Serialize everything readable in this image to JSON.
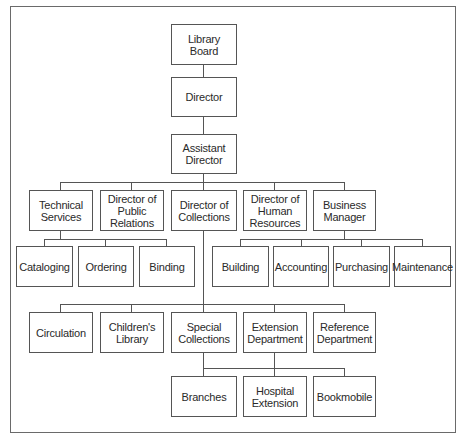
{
  "chart": {
    "type": "org-chart",
    "nodes": {
      "library_board": "Library\nBoard",
      "director": "Director",
      "assistant_director": "Assistant\nDirector",
      "technical_services": "Technical\nServices",
      "public_relations": "Director of\nPublic\nRelations",
      "collections": "Director of\nCollections",
      "human_resources": "Director of\nHuman\nResources",
      "business_manager": "Business\nManager",
      "cataloging": "Cataloging",
      "ordering": "Ordering",
      "binding": "Binding",
      "building": "Building",
      "accounting": "Accounting",
      "purchasing": "Purchasing",
      "maintenance": "Maintenance",
      "circulation": "Circulation",
      "childrens_library": "Children's\nLibrary",
      "special_collections": "Special\nCollections",
      "extension_department": "Extension\nDepartment",
      "reference_department": "Reference\nDepartment",
      "branches": "Branches",
      "hospital_extension": "Hospital\nExtension",
      "bookmobile": "Bookmobile"
    },
    "edges": [
      [
        "library_board",
        "director"
      ],
      [
        "director",
        "assistant_director"
      ],
      [
        "assistant_director",
        "technical_services"
      ],
      [
        "assistant_director",
        "public_relations"
      ],
      [
        "assistant_director",
        "collections"
      ],
      [
        "assistant_director",
        "human_resources"
      ],
      [
        "assistant_director",
        "business_manager"
      ],
      [
        "technical_services",
        "cataloging"
      ],
      [
        "technical_services",
        "ordering"
      ],
      [
        "technical_services",
        "binding"
      ],
      [
        "business_manager",
        "building"
      ],
      [
        "business_manager",
        "accounting"
      ],
      [
        "business_manager",
        "purchasing"
      ],
      [
        "business_manager",
        "maintenance"
      ],
      [
        "collections",
        "circulation"
      ],
      [
        "collections",
        "childrens_library"
      ],
      [
        "collections",
        "special_collections"
      ],
      [
        "collections",
        "extension_department"
      ],
      [
        "collections",
        "reference_department"
      ],
      [
        "extension_department",
        "branches"
      ],
      [
        "extension_department",
        "hospital_extension"
      ],
      [
        "extension_department",
        "bookmobile"
      ]
    ]
  }
}
